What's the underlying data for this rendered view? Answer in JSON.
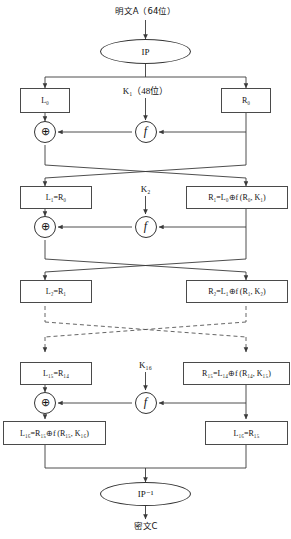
{
  "diagram": {
    "type": "flowchart",
    "plaintext_label": "明文A（64位）",
    "ciphertext_label": "密文C",
    "ip_label": "IP",
    "ip_inverse_label": "IP⁻¹",
    "xor_glyph": "⊕",
    "function_glyph": "f",
    "rounds": [
      {
        "index": 1,
        "key_label": "K₁（48位）",
        "left_box": "L₀",
        "right_box": "R₀",
        "out_left_box": "L₁=R₀",
        "out_right_box": "R₁=L₀⊕f (R₀, K₁)"
      },
      {
        "index": 2,
        "key_label": "K₂",
        "left_box": "L₁=R₀",
        "right_box": "R₁=L₀⊕f (R₀, K₁)",
        "out_left_box": "L₂=R₁",
        "out_right_box": "R₂=L₁⊕f (R₁, K₂)"
      },
      {
        "index": 16,
        "key_label": "K₁₆",
        "left_box": "L₁₅=R₁₄",
        "right_box": "R₁₅=L₁₄⊕f (R₁₄, K₁₅)",
        "out_left_box": "L₁₆=R₁₅⊕f (R₁₅, K₁₆)",
        "out_right_box": "L₁₆=R₁₅"
      }
    ],
    "boxes": {
      "l0": "L₀",
      "r0": "R₀",
      "l1": "L₁=R₀",
      "r1": "R₁=L₀⊕f (R₀, K₁)",
      "l2": "L₂=R₁",
      "r2": "R₂=L₁⊕f (R₁, K₂)",
      "l15": "L₁₅=R₁₄",
      "r15": "R₁₅=L₁₄⊕f (R₁₄, K₁₅)",
      "l16": "L₁₆=R₁₅⊕f (R₁₅, K₁₆)",
      "r16": "L₁₆=R₁₅"
    },
    "keys": {
      "k1": "K₁（48位）",
      "k2": "K₂",
      "k16": "K₁₆"
    },
    "colors": {
      "stroke": "#3a3a3a",
      "box_border": "#4a4a4a",
      "dashed": "#555555",
      "background": "#ffffff",
      "text": "#111111"
    },
    "notes": {
      "elision": "dashed crossover lines indicate rounds 3 through 15 omitted"
    }
  }
}
